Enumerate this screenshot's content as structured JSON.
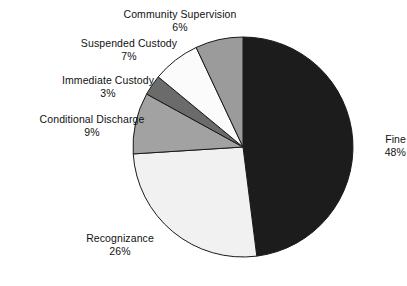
{
  "chart_data": {
    "type": "pie",
    "title": "",
    "subtitle": "",
    "xlabel": "",
    "ylabel": "",
    "grid": false,
    "legend_position": "none",
    "label_style": "callout-outside",
    "units": "percent",
    "start_angle_deg": 0,
    "direction": "clockwise",
    "categories": [
      "Fine",
      "Recognizance",
      "Conditional Discharge",
      "Immediate Custody",
      "Suspended Custody",
      "Community Supervision"
    ],
    "values": [
      48,
      26,
      9,
      3,
      7,
      6
    ],
    "slices": [
      {
        "label": "Fine",
        "value": 48,
        "value_text": "48%",
        "color": "#1c1c1c",
        "start_deg": 0,
        "end_deg": 172.8
      },
      {
        "label": "Recognizance",
        "value": 26,
        "value_text": "26%",
        "color": "#f1f1f1",
        "start_deg": 172.8,
        "end_deg": 266.4
      },
      {
        "label": "Conditional Discharge",
        "value": 9,
        "value_text": "9%",
        "color": "#a2a2a2",
        "start_deg": 266.4,
        "end_deg": 298.8
      },
      {
        "label": "Immediate Custody",
        "value": 3,
        "value_text": "3%",
        "color": "#6b6b6b",
        "start_deg": 298.8,
        "end_deg": 309.6
      },
      {
        "label": "Suspended Custody",
        "value": 7,
        "value_text": "7%",
        "color": "#fbfbfb",
        "start_deg": 309.6,
        "end_deg": 334.8
      },
      {
        "label": "Community Supervision",
        "value": 6,
        "value_text": "6%",
        "color": "#9b9b9b",
        "start_deg": 334.8,
        "end_deg": 360
      }
    ]
  },
  "annotations": {
    "community_supervision": {
      "label": "Community Supervision",
      "value_text": "6%"
    },
    "suspended_custody": {
      "label": "Suspended Custody",
      "value_text": "7%"
    },
    "immediate_custody": {
      "label": "Immediate Custody",
      "value_text": "3%"
    },
    "conditional_discharge": {
      "label": "Conditional Discharge",
      "value_text": "9%"
    },
    "recognizance": {
      "label": "Recognizance",
      "value_text": "26%"
    },
    "fine": {
      "label": "Fine",
      "value_text": "48%"
    }
  },
  "geometry": {
    "center_x": 243,
    "center_y": 147,
    "radius": 110
  },
  "colors": {
    "background": "#ffffff",
    "outline": "#1a1a1a",
    "text": "#111111"
  }
}
